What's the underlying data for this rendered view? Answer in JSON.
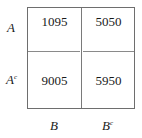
{
  "table": {
    "row_labels": [
      {
        "base": "A",
        "sup": ""
      },
      {
        "base": "A",
        "sup": "c"
      }
    ],
    "col_labels": [
      {
        "base": "B",
        "sup": ""
      },
      {
        "base": "B",
        "sup": "c"
      }
    ],
    "cells": [
      [
        "1095",
        "5050"
      ],
      [
        "9005",
        "5950"
      ]
    ]
  },
  "colors": {
    "border": "#6e6e6e",
    "text": "#1a1a1a",
    "background": "#ffffff"
  }
}
